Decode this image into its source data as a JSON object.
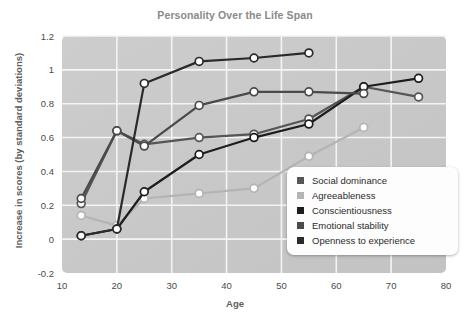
{
  "chart_data": {
    "type": "line",
    "title": "Personality Over the Life Span",
    "xlabel": "Age",
    "ylabel": "Increase in scores (by standard deviations)",
    "xlim": [
      10,
      80
    ],
    "ylim": [
      -0.2,
      1.2
    ],
    "xticks": [
      "10",
      "20",
      "30",
      "40",
      "50",
      "60",
      "70",
      "80"
    ],
    "yticks": [
      "1.2",
      "1",
      "0.8",
      "0.6",
      "0.4",
      "0.2",
      "0",
      "-0.2"
    ],
    "grid": true,
    "legend_position": "inside-bottom-right",
    "plot_background": "#c9c9c9",
    "marker": "open-circle",
    "series": [
      {
        "name": "Social dominance",
        "color": "#555555",
        "x": [
          13.5,
          20,
          25,
          35,
          45,
          55,
          65,
          75
        ],
        "y": [
          0.21,
          0.64,
          0.56,
          0.6,
          0.62,
          0.71,
          0.9,
          0.84
        ]
      },
      {
        "name": "Agreeableness",
        "color": "#b4b4b4",
        "x": [
          13.5,
          20,
          25,
          35,
          45,
          55,
          65
        ],
        "y": [
          0.14,
          0.08,
          0.24,
          0.27,
          0.3,
          0.49,
          0.66
        ]
      },
      {
        "name": "Conscientiousness",
        "color": "#1d1d1d",
        "x": [
          13.5,
          20,
          25,
          35,
          45,
          55,
          65,
          75
        ],
        "y": [
          0.02,
          0.06,
          0.28,
          0.5,
          0.6,
          0.68,
          0.9,
          0.95
        ]
      },
      {
        "name": "Emotional stability",
        "color": "#4a4a4a",
        "x": [
          13.5,
          20,
          25,
          35,
          45,
          55,
          65
        ],
        "y": [
          0.24,
          0.64,
          0.55,
          0.79,
          0.87,
          0.87,
          0.86
        ]
      },
      {
        "name": "Openness to experience",
        "color": "#2a2a2a",
        "x": [
          13.5,
          20,
          25,
          35,
          45,
          55
        ],
        "y": [
          0.02,
          0.06,
          0.92,
          1.05,
          1.07,
          1.1
        ]
      }
    ]
  },
  "legend": {
    "items": [
      {
        "label": "Social dominance",
        "swatch": "#555555"
      },
      {
        "label": "Agreeableness",
        "swatch": "#b4b4b4"
      },
      {
        "label": "Conscientiousness",
        "swatch": "#1d1d1d"
      },
      {
        "label": "Emotional stability",
        "swatch": "#4a4a4a"
      },
      {
        "label": "Openness to experience",
        "swatch": "#2a2a2a"
      }
    ]
  }
}
